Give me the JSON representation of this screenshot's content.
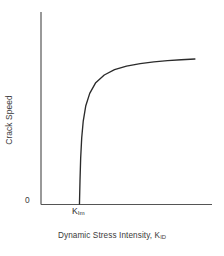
{
  "figure": {
    "background_color": "#ffffff",
    "line_color": "#2b2b2b",
    "axis_color": "#555555",
    "text_color": "#3a3a3a"
  },
  "labels": {
    "y_axis_title": "Crack Speed",
    "x_axis_title_main": "Dynamic Stress Intensity, K",
    "x_axis_title_subscript": "ID",
    "origin_tick": "0",
    "threshold_symbol": "K",
    "threshold_subscript": "Im"
  },
  "chart_data": {
    "type": "line",
    "title": "",
    "xlabel": "Dynamic Stress Intensity, K_ID",
    "ylabel": "Crack Speed",
    "grid": false,
    "legend": null,
    "xlim": [
      0,
      1
    ],
    "ylim": [
      0,
      1
    ],
    "xticks": [
      0.0,
      0.225
    ],
    "xticklabels": [
      "0",
      "K_Im"
    ],
    "yticks": [
      0.0
    ],
    "yticklabels": [
      "0"
    ],
    "annotations": [
      {
        "text": "K_Im",
        "x": 0.225,
        "y": 0.0,
        "note": "arrest / minimum dynamic stress intensity at which crack propagation begins"
      }
    ],
    "series": [
      {
        "name": "Crack speed vs dynamic stress intensity",
        "x": [
          0.225,
          0.228,
          0.232,
          0.238,
          0.247,
          0.262,
          0.285,
          0.32,
          0.37,
          0.43,
          0.5,
          0.58,
          0.66,
          0.74,
          0.82,
          0.9
        ],
        "y": [
          0.0,
          0.15,
          0.3,
          0.43,
          0.54,
          0.64,
          0.72,
          0.79,
          0.84,
          0.875,
          0.898,
          0.914,
          0.925,
          0.933,
          0.939,
          0.944
        ]
      }
    ]
  },
  "geometry": {
    "y_axis_x": 41,
    "y_axis_top": 12,
    "x_axis_y": 204,
    "x_axis_right": 212,
    "curve_foot_x": 80,
    "curve_plateau_y": 53,
    "curve_end_x": 186
  }
}
